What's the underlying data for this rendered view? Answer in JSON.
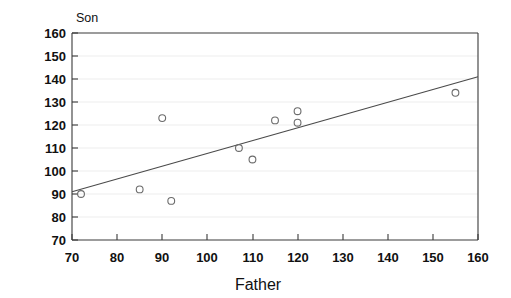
{
  "chart_data": {
    "type": "scatter",
    "title": "",
    "xlabel": "Father",
    "ylabel": "Son",
    "xlim": [
      70,
      160
    ],
    "ylim": [
      70,
      160
    ],
    "xticks": [
      70,
      80,
      90,
      100,
      110,
      120,
      130,
      140,
      150,
      160
    ],
    "yticks": [
      70,
      80,
      90,
      100,
      110,
      120,
      130,
      140,
      150,
      160
    ],
    "grid": "horizontal-faint",
    "legend": "none",
    "marker": "open-circle",
    "x": [
      72,
      85,
      90,
      92,
      107,
      110,
      115,
      120,
      120,
      155
    ],
    "y": [
      90,
      92,
      123,
      87,
      110,
      105,
      122,
      126,
      121,
      134
    ],
    "points": [
      {
        "x": 72,
        "y": 90
      },
      {
        "x": 85,
        "y": 92
      },
      {
        "x": 90,
        "y": 123
      },
      {
        "x": 92,
        "y": 87
      },
      {
        "x": 107,
        "y": 110
      },
      {
        "x": 110,
        "y": 105
      },
      {
        "x": 115,
        "y": 122
      },
      {
        "x": 120,
        "y": 126
      },
      {
        "x": 120,
        "y": 121
      },
      {
        "x": 155,
        "y": 134
      }
    ],
    "fit_line": {
      "name": "regression-line",
      "x_start": 70,
      "y_start": 91,
      "x_end": 160,
      "y_end": 141
    }
  },
  "axis": {
    "y_title": "Son",
    "x_title": "Father",
    "y_tick_labels": [
      "160",
      "150",
      "140",
      "130",
      "120",
      "110",
      "100",
      "90",
      "80",
      "70"
    ],
    "x_tick_labels": [
      "70",
      "80",
      "90",
      "100",
      "110",
      "120",
      "130",
      "140",
      "150",
      "160"
    ]
  },
  "colors": {
    "background": "#ffffff",
    "axis": "#3a3a3a",
    "grid": "#e9e9e9",
    "marker": "#6b6b6b",
    "fit_line": "#4a4a4a",
    "text": "#111111"
  }
}
